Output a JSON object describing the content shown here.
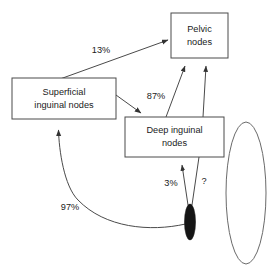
{
  "diagram": {
    "type": "flow-diagram",
    "nodes": [
      {
        "id": "superficial",
        "label_line1": "Superficial",
        "label_line2": "inguinal nodes",
        "shape": "rectangle",
        "x": 12,
        "y": 78,
        "w": 104,
        "h": 41
      },
      {
        "id": "deep",
        "label_line1": "Deep inguinal",
        "label_line2": "nodes",
        "shape": "rectangle",
        "x": 125,
        "y": 117,
        "w": 99,
        "h": 40
      },
      {
        "id": "pelvic",
        "label_line1": "Pelvic",
        "label_line2": "nodes",
        "shape": "rectangle",
        "x": 171,
        "y": 13,
        "w": 57,
        "h": 45
      },
      {
        "id": "primary-tumor",
        "label_line1": "",
        "label_line2": "",
        "shape": "filled-ellipse",
        "cx": 190,
        "cy": 222,
        "rx": 5.5,
        "ry": 18
      },
      {
        "id": "organ",
        "label_line1": "",
        "label_line2": "",
        "shape": "open-ellipse",
        "cx": 246,
        "cy": 193,
        "rx": 20,
        "ry": 71
      }
    ],
    "edges": [
      {
        "id": "superficial-to-pelvic",
        "label": "13%",
        "label_x": 101,
        "label_y": 50,
        "from": "superficial",
        "to": "pelvic"
      },
      {
        "id": "superficial-to-deep",
        "label": "87%",
        "label_x": 156,
        "label_y": 96,
        "from": "superficial",
        "to": "deep"
      },
      {
        "id": "deep-to-pelvic-a",
        "label": "",
        "label_x": 0,
        "label_y": 0,
        "from": "deep",
        "to": "pelvic"
      },
      {
        "id": "deep-to-pelvic-b",
        "label": "",
        "label_x": 0,
        "label_y": 0,
        "from": "deep",
        "to": "pelvic"
      },
      {
        "id": "tumor-to-deep",
        "label": "3%",
        "label_x": 171,
        "label_y": 183,
        "from": "primary-tumor",
        "to": "deep"
      },
      {
        "id": "tumor-to-pelvic-unknown",
        "label": "?",
        "label_x": 203,
        "label_y": 181,
        "from": "primary-tumor",
        "to": "pelvic"
      },
      {
        "id": "tumor-to-superficial",
        "label": "97%",
        "label_x": 70,
        "label_y": 207,
        "from": "primary-tumor",
        "to": "superficial"
      }
    ],
    "colors": {
      "background": "#ffffff",
      "stroke": "#4a4a4a",
      "text": "#1a1a1a",
      "tumor_fill": "#151515",
      "organ_stroke": "#6a6a6a"
    }
  }
}
